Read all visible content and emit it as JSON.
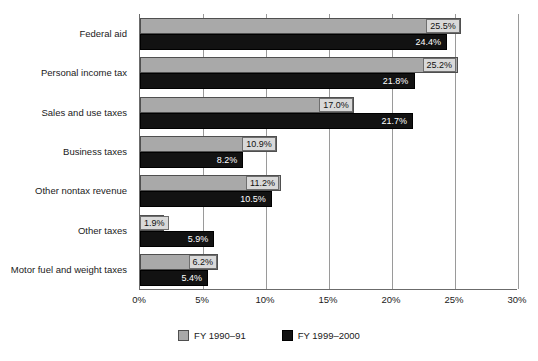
{
  "chart_data": {
    "type": "bar",
    "orientation": "horizontal",
    "title": "",
    "subtitle": "",
    "xlabel": "",
    "ylabel": "",
    "xlim": [
      0,
      30
    ],
    "xticks": [
      "0%",
      "5%",
      "10%",
      "15%",
      "20%",
      "25%",
      "30%"
    ],
    "xtick_values": [
      0,
      5,
      10,
      15,
      20,
      25,
      30
    ],
    "grid": "vertical",
    "legend_position": "bottom-center",
    "categories": [
      "Federal aid",
      "Personal income tax",
      "Sales and use taxes",
      "Business taxes",
      "Other nontax revenue",
      "Other taxes",
      "Motor fuel and weight taxes"
    ],
    "series": [
      {
        "name": "FY 1990–91",
        "color": "#a9a9a9",
        "values": [
          25.5,
          25.2,
          17.0,
          10.9,
          11.2,
          1.9,
          6.2
        ],
        "labels": [
          "25.5%",
          "25.2%",
          "17.0%",
          "10.9%",
          "11.2%",
          "1.9%",
          "6.2%"
        ]
      },
      {
        "name": "FY 1999–2000",
        "color": "#121212",
        "values": [
          24.4,
          21.8,
          21.7,
          8.2,
          10.5,
          5.9,
          5.4
        ],
        "labels": [
          "24.4%",
          "21.8%",
          "21.7%",
          "8.2%",
          "10.5%",
          "5.9%",
          "5.4%"
        ]
      }
    ]
  },
  "colors": {
    "series_1": "#a9a9a9",
    "series_2": "#121212",
    "axis": "#6b6b6b",
    "gridline": "#9a9a9a",
    "background": "#ffffff",
    "label_box": "#d9d9d9"
  }
}
